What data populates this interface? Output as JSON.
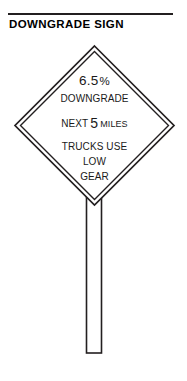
{
  "header": {
    "title": "DOWNGRADE SIGN",
    "rule_color": "#231f20"
  },
  "figure": {
    "name": "downgrade-sign-diagram",
    "stroke_color": "#231f20",
    "fill_color": "#ffffff",
    "sign": {
      "shape": "diamond",
      "border_style": "double-line",
      "lines": [
        {
          "id": "grade",
          "text": "6.5",
          "suffix": "%",
          "emphasis": "large"
        },
        {
          "id": "downgrade",
          "text": "DOWNGRADE"
        },
        {
          "id": "next",
          "prefix": "NEXT",
          "number": "5",
          "unit": "MILES"
        },
        {
          "id": "trucks",
          "text": "TRUCKS USE"
        },
        {
          "id": "low",
          "text": "LOW"
        },
        {
          "id": "gear",
          "text": "GEAR"
        }
      ]
    },
    "post": {
      "name": "sign-post",
      "orientation": "vertical"
    }
  }
}
